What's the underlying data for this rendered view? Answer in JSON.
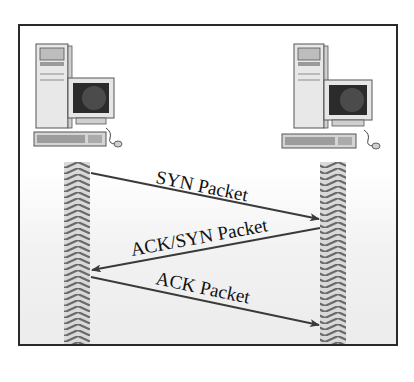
{
  "diagram": {
    "nodes": [
      {
        "id": "client",
        "label": "",
        "icon": "desktop-computer-icon"
      },
      {
        "id": "server",
        "label": "",
        "icon": "desktop-computer-icon"
      }
    ],
    "messages": [
      {
        "from": "client",
        "to": "server",
        "label": "SYN Packet"
      },
      {
        "from": "server",
        "to": "client",
        "label": "ACK/SYN Packet"
      },
      {
        "from": "client",
        "to": "server",
        "label": "ACK Packet"
      }
    ],
    "colors": {
      "border": "#2a2a2a",
      "arrow": "#3a3a3a",
      "lifeline_dark": "#6e6e6e",
      "lifeline_light": "#d8d8d8"
    }
  }
}
